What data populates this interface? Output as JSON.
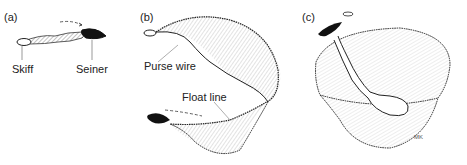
{
  "figure": {
    "panels": [
      {
        "id": "a",
        "tag": "(a)",
        "labels": {
          "skiff": "Skiff",
          "seiner": "Seiner"
        }
      },
      {
        "id": "b",
        "tag": "(b)",
        "labels": {
          "purse_wire": "Purse wire",
          "float_line": "Float line"
        }
      },
      {
        "id": "c",
        "tag": "(c)",
        "labels": {
          "signature": "MK"
        }
      }
    ],
    "colors": {
      "ink": "#1a1a1a",
      "hatch": "#888888",
      "background": "#ffffff"
    }
  }
}
